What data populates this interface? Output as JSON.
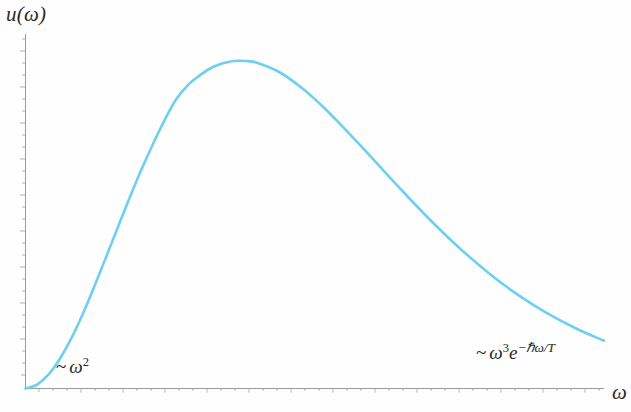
{
  "figure": {
    "y_axis_label": "u(ω)",
    "x_axis_label": "ω",
    "annotation_left": {
      "tilde": "~",
      "base": "ω",
      "exponent": "2",
      "full": "~ ω²"
    },
    "annotation_right": {
      "tilde": "~",
      "base": "ω",
      "exponent": "3",
      "e_symbol": "e",
      "e_exponent": "−ℏω/T",
      "full": "~ ω³e−ℏω/T"
    },
    "curve_color": "#6ECFF0",
    "axis_color": "#9a9a9a",
    "background_color": "#fefefe"
  },
  "chart_data": {
    "type": "line",
    "title": "u(ω)",
    "xlabel": "ω",
    "ylabel": "u(ω)",
    "grid": false,
    "legend": null,
    "axis_tick_labels": [],
    "xlim": [
      0,
      10
    ],
    "ylim": [
      0,
      1.08
    ],
    "series": [
      {
        "name": "Planck spectral density",
        "x": [
          0.0,
          0.2,
          0.4,
          0.6,
          0.8,
          1.0,
          1.2,
          1.4,
          1.6,
          1.8,
          2.0,
          2.2,
          2.4,
          2.6,
          2.82,
          3.0,
          3.2,
          3.4,
          3.6,
          3.8,
          4.0,
          4.4,
          4.8,
          5.2,
          5.6,
          6.0,
          6.5,
          7.0,
          7.5,
          8.0,
          8.5,
          9.0,
          9.5,
          10.0
        ],
        "y": [
          0.0,
          0.009,
          0.033,
          0.071,
          0.12,
          0.178,
          0.243,
          0.311,
          0.38,
          0.448,
          0.513,
          0.573,
          0.629,
          0.678,
          0.714,
          0.734,
          0.752,
          0.763,
          0.769,
          0.769,
          0.765,
          0.742,
          0.703,
          0.654,
          0.598,
          0.54,
          0.466,
          0.395,
          0.33,
          0.272,
          0.221,
          0.178,
          0.142,
          0.112
        ]
      }
    ],
    "annotations": [
      {
        "text": "~ ω²",
        "meaning": "Rayleigh-Jeans low-frequency limit",
        "position": "lower-left"
      },
      {
        "text": "~ ω³e⁻ℏω/T",
        "meaning": "Wien high-frequency exponential tail",
        "position": "lower-right"
      }
    ],
    "peak": {
      "x_px": 155,
      "y_px": 62
    }
  }
}
